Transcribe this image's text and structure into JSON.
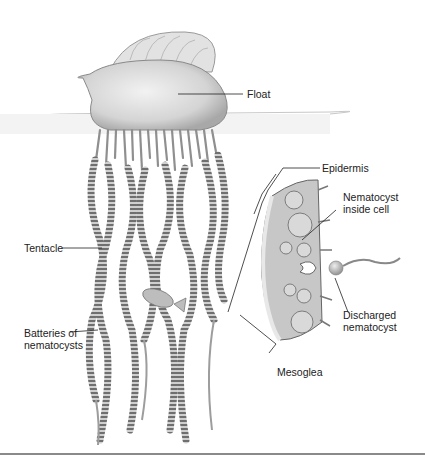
{
  "figure": {
    "labels": {
      "float": "Float",
      "epidermis": "Epidermis",
      "nematocyst_inside_cell_1": "Nematocyst",
      "nematocyst_inside_cell_2": "inside cell",
      "tentacle": "Tentacle",
      "batteries_1": "Batteries of",
      "batteries_2": "nematocysts",
      "discharged_1": "Discharged",
      "discharged_2": "nematocyst",
      "mesoglea": "Mesoglea"
    },
    "colors": {
      "background": "#ffffff",
      "float_fill": "#d8d8d8",
      "tentacle": "#7a7a7a",
      "leader_line": "#222222",
      "text": "#222222",
      "bottom_rule": "#8a8a8a"
    }
  }
}
